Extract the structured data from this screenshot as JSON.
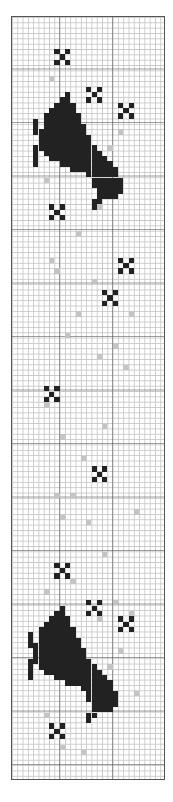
{
  "pattern": {
    "title": "Cat and stars cross-stitch chart",
    "columns": 29,
    "rows": 143,
    "cell_width": 5.3,
    "cell_height": 5.35,
    "colors": {
      "dark": "#222222",
      "light": "#c4c4c4",
      "grid": "#c9c9c9",
      "major_grid": "#555555"
    },
    "stars": [
      [
        9,
        7
      ],
      [
        15,
        14
      ],
      [
        21,
        17
      ],
      [
        8,
        36
      ],
      [
        21,
        46
      ],
      [
        18,
        52
      ],
      [
        7,
        70
      ],
      [
        16,
        85
      ],
      [
        9,
        103
      ],
      [
        15,
        110
      ],
      [
        21,
        113
      ],
      [
        8,
        133
      ]
    ],
    "cat_spans": [
      [
        0,
        10,
        10
      ],
      [
        1,
        9,
        10
      ],
      [
        2,
        8,
        11
      ],
      [
        3,
        7,
        11
      ],
      [
        4,
        6,
        12
      ],
      [
        5,
        6,
        12
      ],
      [
        6,
        6,
        13
      ],
      [
        7,
        5,
        13
      ],
      [
        8,
        5,
        14
      ],
      [
        9,
        5,
        14
      ],
      [
        10,
        5,
        15
      ],
      [
        11,
        6,
        16
      ],
      [
        12,
        7,
        17
      ],
      [
        13,
        9,
        18
      ],
      [
        14,
        11,
        19
      ],
      [
        15,
        14,
        19
      ],
      [
        16,
        15,
        20
      ],
      [
        17,
        15,
        20
      ],
      [
        18,
        16,
        20
      ],
      [
        19,
        16,
        19
      ],
      [
        20,
        15,
        16
      ],
      [
        21,
        15,
        15
      ]
    ],
    "cat_legs": [
      [
        5,
        4
      ],
      [
        6,
        4
      ],
      [
        7,
        4
      ],
      [
        11,
        4
      ],
      [
        12,
        4
      ],
      [
        13,
        4
      ],
      [
        10,
        4
      ]
    ],
    "cats": [
      {
        "origin_col": 0,
        "origin_row": 14
      },
      {
        "origin_col": -1,
        "origin_row": 110
      }
    ],
    "gray_stitches": [
      [
        7,
        11
      ],
      [
        20,
        21
      ],
      [
        11,
        25
      ],
      [
        18,
        24
      ],
      [
        14,
        29
      ],
      [
        6,
        30
      ],
      [
        16,
        35
      ],
      [
        12,
        40
      ],
      [
        7,
        45
      ],
      [
        20,
        45
      ],
      [
        8,
        47
      ],
      [
        15,
        49
      ],
      [
        17,
        51
      ],
      [
        12,
        55
      ],
      [
        22,
        55
      ],
      [
        10,
        59
      ],
      [
        16,
        63
      ],
      [
        19,
        61
      ],
      [
        21,
        65
      ],
      [
        6,
        72
      ],
      [
        17,
        76
      ],
      [
        9,
        78
      ],
      [
        13,
        82
      ],
      [
        14,
        94
      ],
      [
        8,
        89
      ],
      [
        11,
        89
      ],
      [
        9,
        93
      ],
      [
        23,
        92
      ],
      [
        17,
        100
      ],
      [
        11,
        105
      ],
      [
        6,
        107
      ],
      [
        19,
        109
      ],
      [
        22,
        111
      ],
      [
        16,
        112
      ],
      [
        8,
        118
      ],
      [
        20,
        118
      ],
      [
        18,
        121
      ],
      [
        10,
        123
      ],
      [
        23,
        126
      ],
      [
        14,
        127
      ],
      [
        6,
        130
      ],
      [
        9,
        136
      ],
      [
        13,
        137
      ]
    ]
  }
}
